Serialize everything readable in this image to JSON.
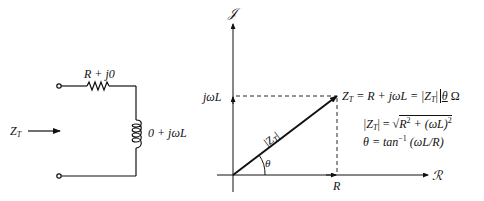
{
  "circuit": {
    "input_label": "Z",
    "input_label_sub": "T",
    "resistor_label": "R + j0",
    "inductor_label": "0 + jωL"
  },
  "phasor_diagram": {
    "imag_axis_label": "𝒥",
    "real_axis_label": "ℛ",
    "y_tick_label": "jωL",
    "x_tick_label": "R",
    "vector_label": "|Z",
    "vector_label_sub": "T",
    "vector_label_end": "|",
    "angle_label": "θ",
    "equation_main": {
      "lhs": "Z",
      "lhs_sub": "T",
      "rhs": " = R + jωL = |Z",
      "rhs_sub": "T",
      "rhs_end": "|",
      "angle": "θ",
      "unit": " Ω"
    },
    "magnitude_eq": {
      "lhs": "|Z",
      "lhs_sub": "T",
      "mid": "| = √",
      "radicand_a": "R",
      "radicand_a_exp": "2",
      "radicand_b": " + (ωL)",
      "radicand_b_exp": "2"
    },
    "angle_eq": {
      "lhs": "θ = tan",
      "exp": "−1",
      "rhs": " (ωL/R)"
    }
  }
}
